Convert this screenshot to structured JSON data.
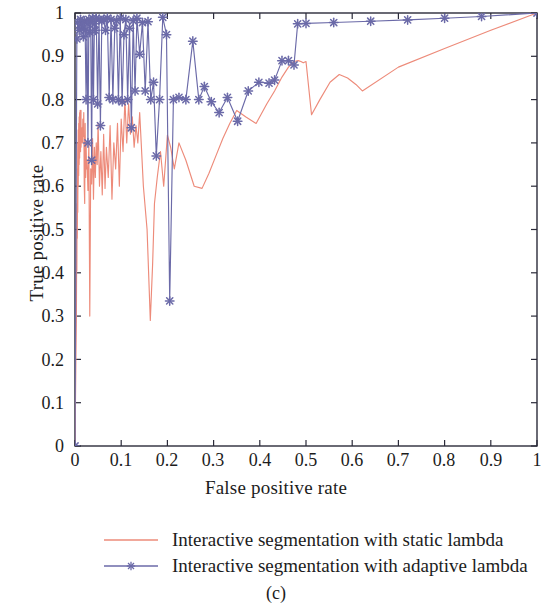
{
  "caption": "(c)",
  "legend": {
    "items": [
      {
        "label": "Interactive segmentation with static lambda",
        "color": "#ED8B7A",
        "marker": "none"
      },
      {
        "label": "Interactive segmentation with adaptive lambda",
        "color": "#6B6AA8",
        "marker": "star-icon"
      }
    ]
  },
  "chart_data": {
    "type": "line",
    "title": "",
    "xlabel": "False positive rate",
    "ylabel": "True positive rate",
    "xlim": [
      0,
      1
    ],
    "ylim": [
      0,
      1
    ],
    "grid": false,
    "legend_position": "below",
    "xticks": [
      "0",
      "0.1",
      "0.2",
      "0.3",
      "0.4",
      "0.5",
      "0.6",
      "0.7",
      "0.8",
      "0.9",
      "1"
    ],
    "yticks": [
      "0",
      "0.1",
      "0.2",
      "0.3",
      "0.4",
      "0.5",
      "0.6",
      "0.7",
      "0.8",
      "0.9",
      "1"
    ],
    "xtick_values": [
      0,
      0.1,
      0.2,
      0.3,
      0.4,
      0.5,
      0.6,
      0.7,
      0.8,
      0.9,
      1
    ],
    "ytick_values": [
      0,
      0.1,
      0.2,
      0.3,
      0.4,
      0.5,
      0.6,
      0.7,
      0.8,
      0.9,
      1
    ],
    "series": [
      {
        "name": "Interactive segmentation with static lambda",
        "color": "#ED8B7A",
        "marker": "none",
        "x": [
          0.0,
          0.002,
          0.003,
          0.004,
          0.004,
          0.005,
          0.005,
          0.006,
          0.006,
          0.007,
          0.007,
          0.008,
          0.008,
          0.009,
          0.009,
          0.01,
          0.01,
          0.011,
          0.012,
          0.012,
          0.013,
          0.013,
          0.014,
          0.015,
          0.016,
          0.017,
          0.018,
          0.019,
          0.02,
          0.021,
          0.022,
          0.023,
          0.024,
          0.025,
          0.026,
          0.028,
          0.03,
          0.032,
          0.034,
          0.036,
          0.038,
          0.04,
          0.042,
          0.044,
          0.046,
          0.048,
          0.05,
          0.053,
          0.056,
          0.059,
          0.062,
          0.065,
          0.068,
          0.072,
          0.076,
          0.08,
          0.084,
          0.088,
          0.092,
          0.096,
          0.1,
          0.104,
          0.108,
          0.112,
          0.116,
          0.12,
          0.124,
          0.128,
          0.132,
          0.136,
          0.14,
          0.148,
          0.156,
          0.163,
          0.168,
          0.172,
          0.178,
          0.185,
          0.192,
          0.2,
          0.207,
          0.215,
          0.225,
          0.24,
          0.258,
          0.275,
          0.29,
          0.305,
          0.32,
          0.335,
          0.35,
          0.37,
          0.392,
          0.415,
          0.432,
          0.448,
          0.462,
          0.474,
          0.483,
          0.489,
          0.494,
          0.5,
          0.512,
          0.53,
          0.552,
          0.572,
          0.59,
          0.608,
          0.622,
          0.7,
          0.8,
          0.9,
          1.0
        ],
        "y": [
          0.0,
          0.205,
          0.3,
          0.56,
          0.405,
          0.64,
          0.48,
          0.7,
          0.54,
          0.73,
          0.6,
          0.745,
          0.625,
          0.76,
          0.65,
          0.77,
          0.665,
          0.775,
          0.68,
          0.7,
          0.775,
          0.69,
          0.72,
          0.735,
          0.7,
          0.755,
          0.715,
          0.77,
          0.6,
          0.56,
          0.745,
          0.62,
          0.7,
          0.64,
          0.66,
          0.59,
          0.7,
          0.3,
          0.64,
          0.605,
          0.71,
          0.57,
          0.69,
          0.62,
          0.7,
          0.65,
          0.745,
          0.6,
          0.68,
          0.58,
          0.72,
          0.595,
          0.69,
          0.62,
          0.74,
          0.57,
          0.7,
          0.64,
          0.745,
          0.6,
          0.755,
          0.68,
          0.8,
          0.7,
          0.79,
          0.72,
          0.76,
          0.69,
          0.74,
          0.7,
          0.77,
          0.6,
          0.5,
          0.29,
          0.42,
          0.56,
          0.62,
          0.68,
          0.6,
          0.718,
          0.69,
          0.64,
          0.7,
          0.66,
          0.6,
          0.595,
          0.63,
          0.67,
          0.71,
          0.745,
          0.775,
          0.76,
          0.745,
          0.79,
          0.82,
          0.852,
          0.875,
          0.888,
          0.89,
          0.888,
          0.885,
          0.888,
          0.765,
          0.8,
          0.84,
          0.858,
          0.85,
          0.835,
          0.82,
          0.875,
          0.918,
          0.96,
          1.0
        ]
      },
      {
        "name": "Interactive segmentation with adaptive lambda",
        "color": "#6B6AA8",
        "marker": "star-icon",
        "x": [
          0.0,
          0.004,
          0.006,
          0.009,
          0.012,
          0.014,
          0.016,
          0.018,
          0.02,
          0.022,
          0.024,
          0.026,
          0.028,
          0.03,
          0.032,
          0.034,
          0.036,
          0.038,
          0.04,
          0.042,
          0.044,
          0.046,
          0.049,
          0.052,
          0.055,
          0.058,
          0.062,
          0.066,
          0.07,
          0.074,
          0.078,
          0.082,
          0.086,
          0.09,
          0.094,
          0.098,
          0.102,
          0.106,
          0.11,
          0.114,
          0.118,
          0.122,
          0.126,
          0.13,
          0.134,
          0.14,
          0.146,
          0.152,
          0.158,
          0.164,
          0.17,
          0.176,
          0.183,
          0.19,
          0.198,
          0.205,
          0.213,
          0.225,
          0.24,
          0.255,
          0.268,
          0.28,
          0.295,
          0.312,
          0.33,
          0.352,
          0.375,
          0.398,
          0.42,
          0.432,
          0.448,
          0.462,
          0.474,
          0.482,
          0.5,
          0.56,
          0.64,
          0.72,
          0.8,
          0.88,
          1.0
        ],
        "y": [
          0.0,
          0.94,
          0.978,
          0.96,
          0.985,
          0.965,
          0.978,
          0.945,
          0.982,
          0.96,
          0.8,
          0.975,
          0.7,
          0.985,
          0.955,
          0.98,
          0.66,
          0.988,
          0.8,
          0.975,
          0.96,
          0.988,
          0.79,
          0.985,
          0.74,
          0.982,
          0.985,
          0.96,
          0.988,
          0.805,
          0.985,
          0.8,
          0.965,
          0.982,
          0.8,
          0.988,
          0.795,
          0.95,
          0.985,
          0.8,
          0.965,
          0.735,
          0.982,
          0.82,
          0.988,
          0.905,
          0.978,
          0.82,
          0.98,
          0.8,
          0.84,
          0.67,
          0.8,
          0.99,
          0.95,
          0.335,
          0.8,
          0.805,
          0.8,
          0.935,
          0.8,
          0.83,
          0.795,
          0.77,
          0.805,
          0.75,
          0.82,
          0.84,
          0.838,
          0.845,
          0.89,
          0.89,
          0.88,
          0.975,
          0.976,
          0.978,
          0.981,
          0.984,
          0.988,
          0.992,
          1.0
        ]
      }
    ]
  }
}
